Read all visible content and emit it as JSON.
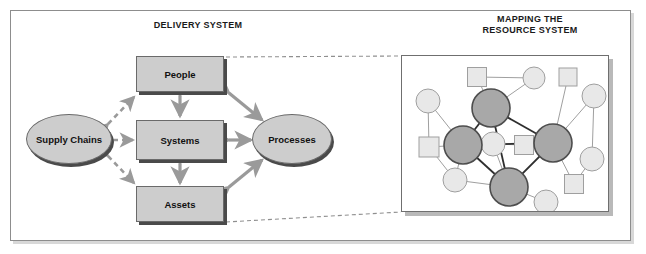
{
  "figure": {
    "headings": {
      "delivery": "DELIVERY SYSTEM",
      "mapping_line1": "MAPPING THE",
      "mapping_line2": "RESOURCE SYSTEM"
    },
    "colors": {
      "node_fill": "#cdcdcd",
      "node_stroke": "#6a6a6a",
      "shadow": "#4a4a4a",
      "arrow_gray": "#9a9a9a",
      "dashed_gray": "#9a9a9a",
      "frame_border": "#8d8d8d",
      "hub_fill": "#a8a8a8",
      "hub_stroke": "#4d4d4d",
      "leaf_fill": "#e8e8e8",
      "leaf_stroke": "#9f9f9f"
    },
    "delivery_system": {
      "boxes": [
        {
          "id": "people",
          "label": "People"
        },
        {
          "id": "systems",
          "label": "Systems"
        },
        {
          "id": "assets",
          "label": "Assets"
        }
      ],
      "ellipses": [
        {
          "id": "supply-chains",
          "label": "Supply Chains"
        },
        {
          "id": "processes",
          "label": "Processes"
        }
      ],
      "connections": [
        {
          "from": "supply-chains",
          "to": "people",
          "style": "dashed",
          "arrows": "both"
        },
        {
          "from": "supply-chains",
          "to": "systems",
          "style": "dashed",
          "arrows": "both"
        },
        {
          "from": "supply-chains",
          "to": "assets",
          "style": "dashed",
          "arrows": "both"
        },
        {
          "from": "people",
          "to": "systems",
          "style": "solid",
          "arrows": "both"
        },
        {
          "from": "systems",
          "to": "assets",
          "style": "solid",
          "arrows": "both"
        },
        {
          "from": "people",
          "to": "processes",
          "style": "solid",
          "arrows": "both"
        },
        {
          "from": "systems",
          "to": "processes",
          "style": "solid",
          "arrows": "both"
        },
        {
          "from": "assets",
          "to": "processes",
          "style": "solid",
          "arrows": "both"
        }
      ],
      "callout_lines": [
        {
          "from": "people-box-top-right",
          "to": "resource-panel-top-left",
          "style": "dashed"
        },
        {
          "from": "assets-box-bottom-right",
          "to": "resource-panel-bottom-left",
          "style": "dashed"
        }
      ]
    },
    "resource_system": {
      "hub_nodes": [
        {
          "id": "hub-top",
          "shape": "circle",
          "cx": 85,
          "cy": 48,
          "r": 19
        },
        {
          "id": "hub-left",
          "shape": "circle",
          "cx": 57,
          "cy": 85,
          "r": 19
        },
        {
          "id": "hub-right",
          "shape": "circle",
          "cx": 147,
          "cy": 83,
          "r": 19
        },
        {
          "id": "hub-bottom",
          "shape": "circle",
          "cx": 103,
          "cy": 127,
          "r": 19
        }
      ],
      "leaf_nodes": [
        {
          "id": "sq-top-left",
          "shape": "square",
          "cx": 71,
          "cy": 17,
          "size": 19
        },
        {
          "id": "circ-top-mid",
          "shape": "circle",
          "cx": 128,
          "cy": 18,
          "r": 11
        },
        {
          "id": "sq-top-right",
          "shape": "square",
          "cx": 162,
          "cy": 17,
          "size": 18
        },
        {
          "id": "circ-upper-left",
          "shape": "circle",
          "cx": 22,
          "cy": 41,
          "r": 12
        },
        {
          "id": "circ-upper-right",
          "shape": "circle",
          "cx": 188,
          "cy": 36,
          "r": 12
        },
        {
          "id": "sq-mid-left",
          "shape": "square",
          "cx": 23,
          "cy": 87,
          "size": 20
        },
        {
          "id": "circ-inner",
          "shape": "circle",
          "cx": 87,
          "cy": 84,
          "r": 12
        },
        {
          "id": "sq-inner",
          "shape": "square",
          "cx": 118,
          "cy": 85,
          "size": 19
        },
        {
          "id": "circ-mid-right",
          "shape": "circle",
          "cx": 186,
          "cy": 99,
          "r": 12
        },
        {
          "id": "circ-low-left",
          "shape": "circle",
          "cx": 49,
          "cy": 120,
          "r": 12
        },
        {
          "id": "sq-low-right",
          "shape": "square",
          "cx": 168,
          "cy": 124,
          "size": 19
        },
        {
          "id": "circ-bottom",
          "shape": "circle",
          "cx": 140,
          "cy": 142,
          "r": 12
        }
      ],
      "hub_edges": [
        [
          "hub-top",
          "hub-left"
        ],
        [
          "hub-top",
          "hub-right"
        ],
        [
          "hub-top",
          "hub-bottom"
        ],
        [
          "hub-left",
          "hub-right"
        ],
        [
          "hub-left",
          "hub-bottom"
        ],
        [
          "hub-right",
          "hub-bottom"
        ]
      ],
      "leaf_edges": [
        [
          "sq-top-left",
          "circ-top-mid"
        ],
        [
          "circ-top-mid",
          "hub-top"
        ],
        [
          "sq-top-left",
          "hub-top"
        ],
        [
          "sq-top-right",
          "hub-right"
        ],
        [
          "circ-upper-right",
          "hub-right"
        ],
        [
          "circ-upper-right",
          "circ-mid-right"
        ],
        [
          "circ-upper-left",
          "sq-mid-left"
        ],
        [
          "circ-upper-left",
          "hub-left"
        ],
        [
          "sq-mid-left",
          "hub-left"
        ],
        [
          "sq-mid-left",
          "circ-low-left"
        ],
        [
          "circ-inner",
          "hub-bottom"
        ],
        [
          "circ-inner",
          "sq-inner"
        ],
        [
          "sq-inner",
          "hub-right"
        ],
        [
          "circ-low-left",
          "hub-bottom"
        ],
        [
          "circ-low-left",
          "hub-left"
        ],
        [
          "circ-mid-right",
          "sq-low-right"
        ],
        [
          "sq-low-right",
          "hub-right"
        ],
        [
          "circ-bottom",
          "hub-bottom"
        ]
      ]
    }
  }
}
